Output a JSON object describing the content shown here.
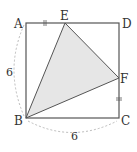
{
  "diagram": {
    "type": "geometry",
    "shape": "square ABCD with shaded triangle BEF",
    "points": {
      "A": {
        "label": "A",
        "x": 26,
        "y": 23
      },
      "D": {
        "label": "D",
        "x": 119,
        "y": 23
      },
      "B": {
        "label": "B",
        "x": 26,
        "y": 118
      },
      "C": {
        "label": "C",
        "x": 119,
        "y": 118
      },
      "E": {
        "label": "E",
        "x": 65,
        "y": 23
      },
      "F": {
        "label": "F",
        "x": 119,
        "y": 78
      }
    },
    "measures": {
      "left_side": "6",
      "bottom_side": "6"
    },
    "equal_marks": [
      "AE",
      "FC"
    ],
    "colors": {
      "line": "#555555",
      "shade": "#e6e6e6",
      "dashed": "#aaaaaa"
    }
  }
}
